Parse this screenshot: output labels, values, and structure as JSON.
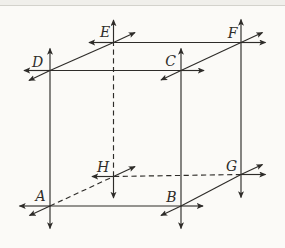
{
  "figure": {
    "colors": {
      "paper": "#fbfaf7",
      "ink": "#2e2c29",
      "band": "#f0efeb"
    },
    "vertices": [
      {
        "name": "A",
        "x": 50,
        "y": 206,
        "label_x": 40.5,
        "label_y": 201
      },
      {
        "name": "B",
        "x": 181,
        "y": 206,
        "label_x": 171.5,
        "label_y": 202
      },
      {
        "name": "C",
        "x": 181,
        "y": 70.5,
        "label_x": 170.5,
        "label_y": 66
      },
      {
        "name": "D",
        "x": 50,
        "y": 70.5,
        "label_x": 37.5,
        "label_y": 67
      },
      {
        "name": "E",
        "x": 113.5,
        "y": 42.5,
        "label_x": 105,
        "label_y": 37
      },
      {
        "name": "F",
        "x": 241,
        "y": 42.5,
        "label_x": 232.5,
        "label_y": 38
      },
      {
        "name": "G",
        "x": 241,
        "y": 174.5,
        "label_x": 231.5,
        "label_y": 171
      },
      {
        "name": "H",
        "x": 113.5,
        "y": 176.5,
        "label_x": 103,
        "label_y": 171.5
      }
    ],
    "edges": [
      {
        "from": "A",
        "to": "B",
        "dashed": false
      },
      {
        "from": "B",
        "to": "C",
        "dashed": false
      },
      {
        "from": "C",
        "to": "D",
        "dashed": false
      },
      {
        "from": "D",
        "to": "A",
        "dashed": false
      },
      {
        "from": "E",
        "to": "F",
        "dashed": false
      },
      {
        "from": "F",
        "to": "G",
        "dashed": false
      },
      {
        "from": "G",
        "to": "H",
        "dashed": true
      },
      {
        "from": "H",
        "to": "E",
        "dashed": true
      },
      {
        "from": "D",
        "to": "E",
        "dashed": false
      },
      {
        "from": "C",
        "to": "F",
        "dashed": false
      },
      {
        "from": "B",
        "to": "G",
        "dashed": false
      },
      {
        "from": "A",
        "to": "H",
        "dashed": true
      }
    ],
    "rays": [
      {
        "at": "D",
        "dir": "up",
        "x2": 50,
        "y2": 48.5
      },
      {
        "at": "D",
        "dir": "left",
        "x2": 24,
        "y2": 70.5
      },
      {
        "at": "D",
        "dir": "back-down-left",
        "x2": 29,
        "y2": 80.5
      },
      {
        "at": "E",
        "dir": "up",
        "x2": 113.5,
        "y2": 20
      },
      {
        "at": "E",
        "dir": "left",
        "x2": 89,
        "y2": 42.5
      },
      {
        "at": "E",
        "dir": "back-up-right",
        "x2": 135,
        "y2": 32.5
      },
      {
        "at": "C",
        "dir": "up",
        "x2": 181,
        "y2": 48.5
      },
      {
        "at": "C",
        "dir": "right",
        "x2": 204,
        "y2": 70.5
      },
      {
        "at": "C",
        "dir": "back-down-left",
        "x2": 161,
        "y2": 80
      },
      {
        "at": "F",
        "dir": "up",
        "x2": 241,
        "y2": 19.5
      },
      {
        "at": "F",
        "dir": "right",
        "x2": 265.5,
        "y2": 42.5
      },
      {
        "at": "F",
        "dir": "back-up-right",
        "x2": 262.5,
        "y2": 32.5
      },
      {
        "at": "A",
        "dir": "down",
        "x2": 50,
        "y2": 228.5
      },
      {
        "at": "A",
        "dir": "left",
        "x2": 19.5,
        "y2": 206
      },
      {
        "at": "A",
        "dir": "back-down-left",
        "x2": 29.5,
        "y2": 215.5
      },
      {
        "at": "H",
        "dir": "down",
        "x2": 113.5,
        "y2": 198
      },
      {
        "at": "H",
        "dir": "left",
        "x2": 92,
        "y2": 176.5
      },
      {
        "at": "H",
        "dir": "back-up-right",
        "x2": 135,
        "y2": 166.5
      },
      {
        "at": "B",
        "dir": "down",
        "x2": 181,
        "y2": 228.5
      },
      {
        "at": "B",
        "dir": "right",
        "x2": 203,
        "y2": 206
      },
      {
        "at": "B",
        "dir": "back-down-left",
        "x2": 161,
        "y2": 215.5
      },
      {
        "at": "G",
        "dir": "down",
        "x2": 241,
        "y2": 197.5
      },
      {
        "at": "G",
        "dir": "right",
        "x2": 265.5,
        "y2": 174.5
      },
      {
        "at": "G",
        "dir": "back-up-right",
        "x2": 262.5,
        "y2": 164.5
      }
    ]
  }
}
